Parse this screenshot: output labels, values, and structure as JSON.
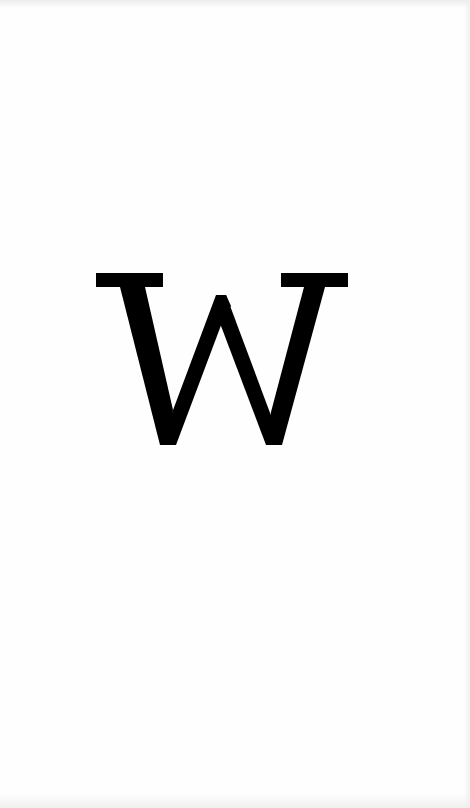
{
  "logo": {
    "glyph": "W",
    "color": "#000000"
  },
  "background": {
    "color": "#fefefe"
  }
}
